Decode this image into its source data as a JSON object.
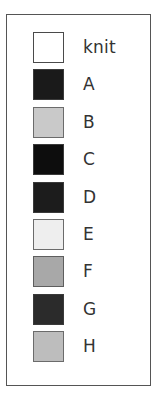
{
  "panel": {
    "type": "legend",
    "border_color": "#555555",
    "background_color": "#ffffff",
    "text_color": "#333333"
  },
  "chart_data": {
    "type": "table",
    "title": "",
    "subtitle": "",
    "xlabel": "",
    "ylabel": "",
    "legend_position": "standalone",
    "grid": false,
    "categories": [
      "knit",
      "A",
      "B",
      "C",
      "D",
      "E",
      "F",
      "G",
      "H"
    ],
    "entries": [
      {
        "label": "knit",
        "color": "#ffffff",
        "border": "#4a4a4a"
      },
      {
        "label": "A",
        "color": "#1a1a1a",
        "border": "#3a3a3a"
      },
      {
        "label": "B",
        "color": "#c9c9c9",
        "border": "#6b6b6b"
      },
      {
        "label": "C",
        "color": "#0d0d0d",
        "border": "#3a3a3a"
      },
      {
        "label": "D",
        "color": "#1c1c1c",
        "border": "#3a3a3a"
      },
      {
        "label": "E",
        "color": "#eeeeee",
        "border": "#6b6b6b"
      },
      {
        "label": "F",
        "color": "#a8a8a8",
        "border": "#5e5e5e"
      },
      {
        "label": "G",
        "color": "#2b2b2b",
        "border": "#3a3a3a"
      },
      {
        "label": "H",
        "color": "#bdbdbd",
        "border": "#6b6b6b"
      }
    ]
  }
}
